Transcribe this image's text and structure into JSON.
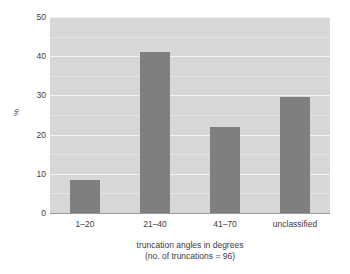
{
  "chart_data": {
    "type": "bar",
    "title": "",
    "categories": [
      "1–20",
      "21–40",
      "41–70",
      "unclassified"
    ],
    "values": [
      8.5,
      41,
      22,
      29.5
    ],
    "xlabel": "truncation angles in degrees",
    "xlabel_sub": "(no. of truncations = 96)",
    "ylabel": "%",
    "ylim": [
      0,
      50
    ],
    "yticks": [
      0,
      10,
      20,
      30,
      40,
      50
    ],
    "ytick_labels": [
      "0",
      "10",
      "20",
      "30",
      "40",
      "50"
    ],
    "minor_gridlines": [
      5,
      15,
      25,
      35,
      45
    ],
    "grid": true,
    "legend": "none",
    "colors": {
      "bar": "#7f7f7f",
      "panel_background": "#d7d7d7",
      "gridline": "#f2f2f2",
      "text": "#3c3c3c"
    }
  }
}
